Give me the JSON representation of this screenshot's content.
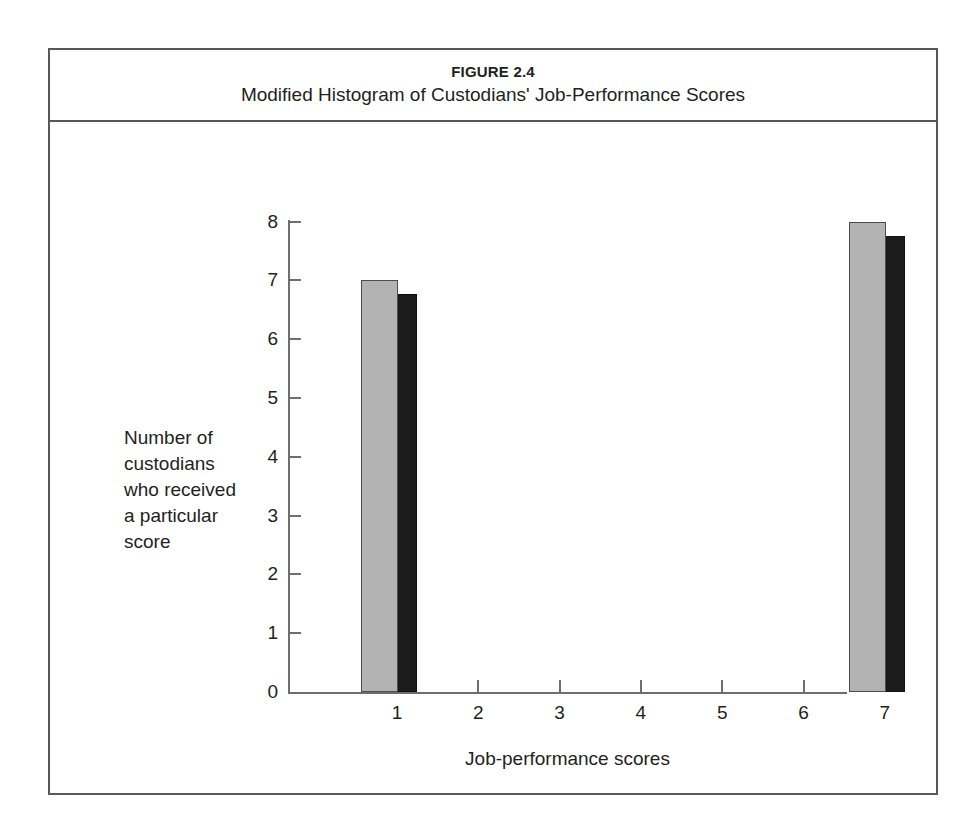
{
  "figure": {
    "number": "FIGURE 2.4",
    "title": "Modified Histogram of Custodians' Job-Performance Scores"
  },
  "axis_label_lines": {
    "l1": "Number of",
    "l2": "custodians",
    "l3": "who received",
    "l4": "a particular",
    "l5": "score"
  },
  "colors": {
    "bar_face": "#b3b3b3",
    "bar_shadow": "#1b1b1b",
    "axis": "#6d6e71",
    "frame": "#58585b",
    "text": "#231f20"
  },
  "chart_data": {
    "type": "bar",
    "title": "Modified Histogram of Custodians' Job-Performance Scores",
    "categories": [
      "1",
      "2",
      "3",
      "4",
      "5",
      "6",
      "7"
    ],
    "values": [
      7,
      0,
      0,
      0,
      0,
      0,
      8
    ],
    "xlabel": "Job-performance scores",
    "ylabel": "Number of custodians who received a particular score",
    "xlim": [
      0.5,
      7.5
    ],
    "ylim": [
      0,
      8
    ],
    "ytick_labels": [
      "0",
      "1",
      "2",
      "3",
      "4",
      "5",
      "6",
      "7",
      "8"
    ],
    "ytick_values": [
      0,
      1,
      2,
      3,
      4,
      5,
      6,
      7,
      8
    ],
    "xtick_labels": [
      "1",
      "2",
      "3",
      "4",
      "5",
      "6",
      "7"
    ],
    "grid": false,
    "legend": null,
    "style": "3d-shadowed-bars"
  }
}
